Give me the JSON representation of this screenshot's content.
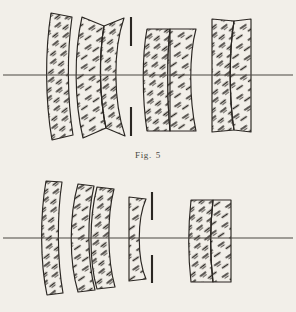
{
  "document": {
    "background_color": "#f2efe9",
    "ink_color": "#2b2723",
    "axis_color": "#5a564f",
    "page_width": 296,
    "page_height": 312
  },
  "caption": {
    "label": "Fig.",
    "number": "5",
    "full_text": "Fig. 5"
  },
  "figures": [
    {
      "id": "upper-lens-diagram",
      "name": "Fig. 5 upper optical system",
      "optical_axis": {
        "y": 75,
        "x_start": 2,
        "x_end": 294
      },
      "aperture_stop": {
        "name": "aperture-stop",
        "x": 131,
        "upper_bar": {
          "y_top": 17,
          "y_bottom": 46
        },
        "lower_bar": {
          "y_top": 107,
          "y_bottom": 136
        }
      },
      "elements": [
        {
          "index": 1,
          "name": "lens-element-1",
          "type": "meniscus",
          "group": "front-meniscus",
          "x_left": 47,
          "x_right": 74,
          "y_top": 12,
          "y_bottom": 141
        },
        {
          "index": 2,
          "name": "lens-element-2",
          "type": "meniscus",
          "group": "cemented-doublet-1",
          "x_left": 78,
          "x_right": 104,
          "y_top": 16,
          "y_bottom": 138
        },
        {
          "index": 3,
          "name": "lens-element-3",
          "type": "meniscus",
          "group": "cemented-doublet-1",
          "x_left": 104,
          "x_right": 125,
          "y_top": 16,
          "y_bottom": 138
        },
        {
          "index": 4,
          "name": "lens-element-4",
          "type": "meniscus",
          "group": "cemented-doublet-2",
          "x_left": 145,
          "x_right": 169,
          "y_top": 28,
          "y_bottom": 132
        },
        {
          "index": 5,
          "name": "lens-element-5",
          "type": "biconvex",
          "group": "cemented-doublet-2",
          "x_left": 169,
          "x_right": 197,
          "y_top": 28,
          "y_bottom": 132
        },
        {
          "index": 6,
          "name": "lens-element-6",
          "type": "biconvex",
          "group": "rear-doublet",
          "x_left": 212,
          "x_right": 233,
          "y_top": 18,
          "y_bottom": 133
        },
        {
          "index": 7,
          "name": "lens-element-7",
          "type": "meniscus",
          "group": "rear-doublet",
          "x_left": 233,
          "x_right": 251,
          "y_top": 18,
          "y_bottom": 133
        }
      ]
    },
    {
      "id": "lower-lens-diagram",
      "name": "Fig. 5 lower optical system",
      "optical_axis": {
        "y": 238,
        "x_start": 2,
        "x_end": 294
      },
      "aperture_stop": {
        "name": "aperture-stop",
        "x": 152,
        "upper_bar": {
          "y_top": 192,
          "y_bottom": 220
        },
        "lower_bar": {
          "y_top": 255,
          "y_bottom": 283
        }
      },
      "elements": [
        {
          "index": 1,
          "name": "lens-element-1",
          "type": "meniscus",
          "group": "front-meniscus",
          "x_left": 42,
          "x_right": 64,
          "y_top": 180,
          "y_bottom": 296
        },
        {
          "index": 2,
          "name": "lens-element-2",
          "type": "meniscus",
          "group": "second-group",
          "x_left": 72,
          "x_right": 96,
          "y_top": 183,
          "y_bottom": 293
        },
        {
          "index": 3,
          "name": "lens-element-3",
          "type": "meniscus",
          "group": "second-group",
          "x_left": 94,
          "x_right": 116,
          "y_top": 186,
          "y_bottom": 290
        },
        {
          "index": 4,
          "name": "lens-element-4",
          "type": "negative-meniscus",
          "group": "stop-group",
          "x_left": 128,
          "x_right": 147,
          "y_top": 196,
          "y_bottom": 281
        },
        {
          "index": 5,
          "name": "lens-element-5",
          "type": "biconvex",
          "group": "rear-doublet",
          "x_left": 190,
          "x_right": 213,
          "y_top": 199,
          "y_bottom": 283
        },
        {
          "index": 6,
          "name": "lens-element-6",
          "type": "meniscus",
          "group": "rear-doublet",
          "x_left": 213,
          "x_right": 232,
          "y_top": 199,
          "y_bottom": 283
        }
      ]
    }
  ]
}
